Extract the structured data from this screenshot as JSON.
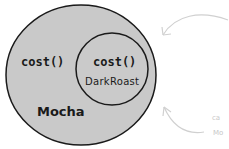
{
  "diagram": {
    "outer": {
      "name": "Mocha",
      "method": "cost()"
    },
    "inner": {
      "name": "DarkRoast",
      "method": "cost()"
    },
    "colors": {
      "fill": "#c9c9c9",
      "stroke": "#1a1a1a",
      "arrow": "#d0d0d0"
    },
    "side_text": [
      "ca",
      "Mo"
    ]
  }
}
